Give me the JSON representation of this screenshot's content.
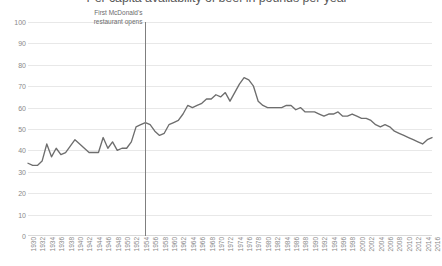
{
  "chart_data": {
    "type": "line",
    "title": "Per capita availability of beef in pounds per year",
    "xlabel": "",
    "ylabel": "",
    "ylim": [
      0,
      100
    ],
    "xlim": [
      1930,
      2016
    ],
    "grid": true,
    "legend": false,
    "y_ticks": [
      100,
      90,
      80,
      70,
      60,
      50,
      40,
      30,
      20,
      10,
      0
    ],
    "x_ticks": [
      1930,
      1932,
      1934,
      1936,
      1938,
      1940,
      1942,
      1944,
      1946,
      1948,
      1950,
      1952,
      1954,
      1956,
      1958,
      1960,
      1962,
      1964,
      1966,
      1968,
      1970,
      1972,
      1974,
      1976,
      1978,
      1980,
      1982,
      1984,
      1986,
      1988,
      1990,
      1992,
      1994,
      1996,
      1998,
      2000,
      2002,
      2004,
      2006,
      2008,
      2010,
      2012,
      2014,
      2016
    ],
    "series": [
      {
        "name": "Beef availability (lbs per capita per year)",
        "x": [
          1930,
          1931,
          1932,
          1933,
          1934,
          1935,
          1936,
          1937,
          1938,
          1939,
          1940,
          1941,
          1942,
          1943,
          1944,
          1945,
          1946,
          1947,
          1948,
          1949,
          1950,
          1951,
          1952,
          1953,
          1954,
          1955,
          1956,
          1957,
          1958,
          1959,
          1960,
          1961,
          1962,
          1963,
          1964,
          1965,
          1966,
          1967,
          1968,
          1969,
          1970,
          1971,
          1972,
          1973,
          1974,
          1975,
          1976,
          1977,
          1978,
          1979,
          1980,
          1981,
          1982,
          1983,
          1984,
          1985,
          1986,
          1987,
          1988,
          1989,
          1990,
          1991,
          1992,
          1993,
          1994,
          1995,
          1996,
          1997,
          1998,
          1999,
          2000,
          2001,
          2002,
          2003,
          2004,
          2005,
          2006,
          2007,
          2008,
          2009,
          2010,
          2011,
          2012,
          2013,
          2014,
          2015,
          2016
        ],
        "values": [
          34,
          33,
          33,
          35,
          43,
          37,
          41,
          38,
          39,
          42,
          45,
          43,
          41,
          39,
          39,
          39,
          46,
          41,
          44,
          40,
          41,
          41,
          44,
          51,
          52,
          53,
          52,
          49,
          47,
          48,
          52,
          53,
          54,
          57,
          61,
          60,
          61,
          62,
          64,
          64,
          66,
          65,
          67,
          63,
          67,
          71,
          74,
          73,
          70,
          63,
          61,
          60,
          60,
          60,
          60,
          61,
          61,
          59,
          60,
          58,
          58,
          58,
          57,
          56,
          57,
          57,
          58,
          56,
          56,
          57,
          56,
          55,
          55,
          54,
          52,
          51,
          52,
          51,
          49,
          48,
          47,
          46,
          45,
          44,
          43,
          45,
          46
        ],
        "color": "#6e6e6e"
      }
    ],
    "annotations": [
      {
        "name": "first-mcdonalds",
        "text_line_1": "First McDonald's",
        "text_line_2": "restaurant opens",
        "x_value": 1955,
        "marker": "vertical-line",
        "marker_color": "#7f7f7f"
      }
    ]
  }
}
